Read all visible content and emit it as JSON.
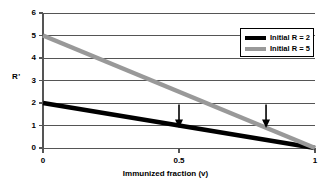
{
  "chart_data": {
    "type": "line",
    "title": "",
    "xlabel": "Immunized fraction  (v)",
    "ylabel": "R'",
    "xlim": [
      0,
      1
    ],
    "ylim": [
      0,
      6
    ],
    "xticks": [
      "0",
      "0.5",
      "1"
    ],
    "xtick_values": [
      0,
      0.5,
      1
    ],
    "yticks": [
      "0",
      "1",
      "2",
      "3",
      "4",
      "5",
      "6"
    ],
    "ytick_values": [
      0,
      1,
      2,
      3,
      4,
      5,
      6
    ],
    "grid": true,
    "grid_axis": "y",
    "legend_position": "top-right",
    "series": [
      {
        "name": "Initial R = 2",
        "color": "#000000",
        "x": [
          0,
          1
        ],
        "values": [
          2,
          0
        ]
      },
      {
        "name": "Initial R = 5",
        "color": "#999999",
        "x": [
          0,
          1
        ],
        "values": [
          5,
          0
        ]
      }
    ],
    "annotations": [
      {
        "type": "arrow",
        "direction": "down",
        "x": 0.5,
        "y": 1,
        "label": "",
        "note": "threshold crossing for Initial R = 2"
      },
      {
        "type": "arrow",
        "direction": "down",
        "x": 0.82,
        "y": 1,
        "label": "",
        "note": "threshold crossing for Initial R = 5"
      }
    ]
  },
  "legend": {
    "entries": [
      {
        "label": "Initial R = 2",
        "color": "#000000"
      },
      {
        "label": "Initial R = 5",
        "color": "#999999"
      }
    ]
  },
  "axes": {
    "y_title": "R'",
    "x_title": "Immunized fraction  (v)",
    "y_labels": {
      "t0": "0",
      "t1": "1",
      "t2": "2",
      "t3": "3",
      "t4": "4",
      "t5": "5",
      "t6": "6"
    },
    "x_labels": {
      "t0": "0",
      "t1": "0.5",
      "t2": "1"
    }
  }
}
